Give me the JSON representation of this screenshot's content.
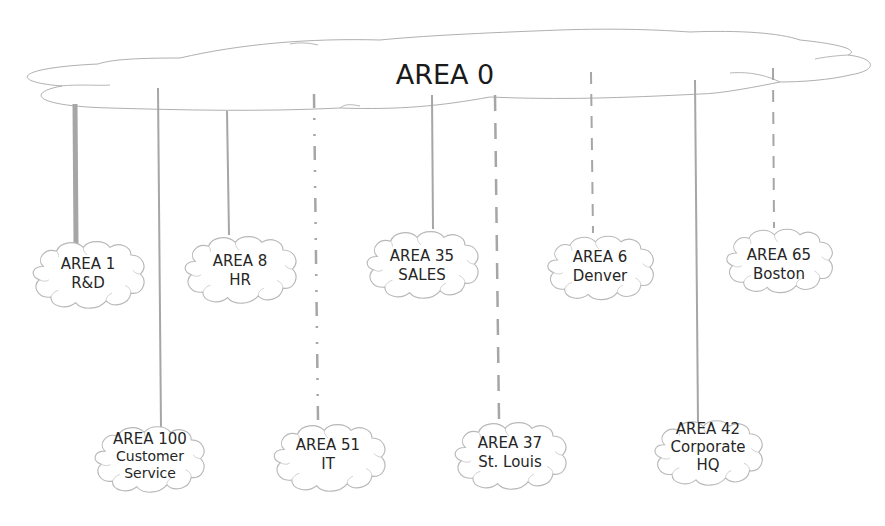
{
  "diagram": {
    "backbone": {
      "label": "AREA 0"
    },
    "colors": {
      "line": "#a6a6a6",
      "cloud_stroke": "#b8b8b8",
      "text": "#262626"
    },
    "areas": [
      {
        "id": "area-1",
        "title": "AREA 1",
        "subtitle": "R&D",
        "link_style": "thick-solid"
      },
      {
        "id": "area-100",
        "title": "AREA 100",
        "subtitle": "Customer Service",
        "link_style": "solid"
      },
      {
        "id": "area-8",
        "title": "AREA 8",
        "subtitle": "HR",
        "link_style": "solid"
      },
      {
        "id": "area-51",
        "title": "AREA 51",
        "subtitle": "IT",
        "link_style": "dash-dot-dot"
      },
      {
        "id": "area-35",
        "title": "AREA 35",
        "subtitle": "SALES",
        "link_style": "solid"
      },
      {
        "id": "area-37",
        "title": "AREA 37",
        "subtitle": "St. Louis",
        "link_style": "long-dash"
      },
      {
        "id": "area-6",
        "title": "AREA 6",
        "subtitle": "Denver",
        "link_style": "dashed"
      },
      {
        "id": "area-42",
        "title": "AREA 42",
        "subtitle": "Corporate HQ",
        "link_style": "solid"
      },
      {
        "id": "area-65",
        "title": "AREA 65",
        "subtitle": "Boston",
        "link_style": "dashed"
      }
    ]
  }
}
